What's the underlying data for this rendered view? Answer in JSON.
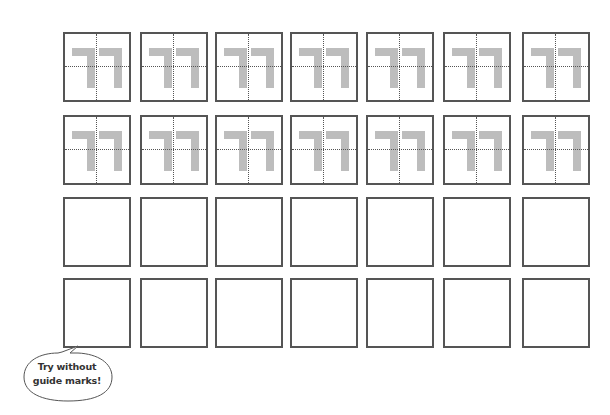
{
  "worksheet": {
    "character": "ㄲ",
    "character_name": "ssang-giyeok",
    "colors": {
      "border": "#555555",
      "glyph": "#bdbdbd",
      "guide": "#555555",
      "text": "#333333"
    },
    "rows": [
      {
        "type": "guided",
        "boxes": 7
      },
      {
        "type": "guided",
        "boxes": 7
      },
      {
        "type": "blank",
        "boxes": 7
      },
      {
        "type": "blank",
        "boxes": 7
      }
    ],
    "column_x": [
      63,
      140,
      215,
      290,
      366,
      443,
      522
    ],
    "row_y": [
      32,
      115,
      197,
      278
    ]
  },
  "hint_bubble": {
    "line1": "Try without",
    "line2": "guide marks!"
  }
}
